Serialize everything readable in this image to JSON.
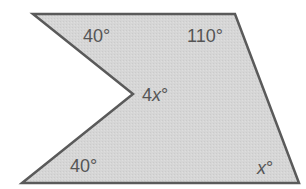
{
  "diagram": {
    "type": "concave pentagon",
    "fill_color": "#d4d4d4",
    "stroke_color": "#5a5a5a",
    "vertices": [
      [
        33,
        14
      ],
      [
        235,
        14
      ],
      [
        299,
        183
      ],
      [
        22,
        183
      ],
      [
        133,
        94
      ]
    ],
    "angles": [
      {
        "vertex": "top-left",
        "label": "40°"
      },
      {
        "vertex": "top-right",
        "label": "110°"
      },
      {
        "vertex": "inner (reflex side)",
        "label": "4x°"
      },
      {
        "vertex": "bottom-left",
        "label": "40°"
      },
      {
        "vertex": "bottom-right",
        "label": "x°"
      }
    ]
  },
  "labels": {
    "top_left": "40°",
    "top_right": "110°",
    "inner_num": "4",
    "inner_var": "x",
    "inner_deg": "°",
    "bottom_left": "40°",
    "bottom_right_var": "x",
    "bottom_right_deg": "°"
  }
}
